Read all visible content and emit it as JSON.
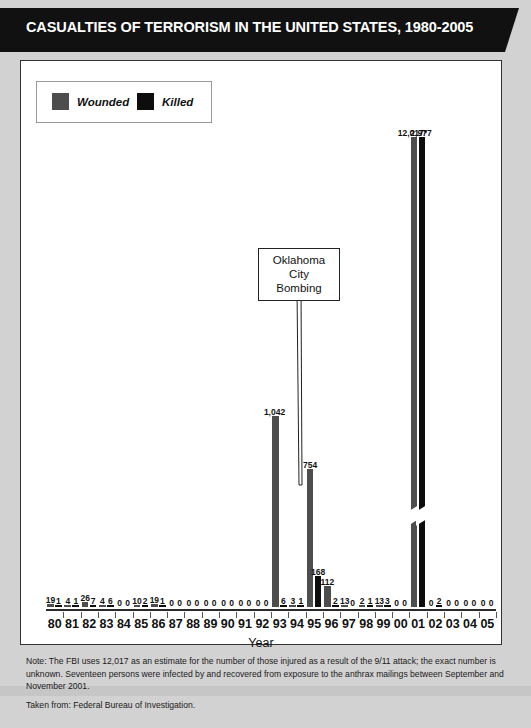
{
  "banner": {
    "title": "CASUALTIES OF TERRORISM IN THE UNITED STATES, 1980-2005"
  },
  "legend": {
    "wounded_label": "Wounded",
    "killed_label": "Killed",
    "wounded_color": "#4d4d4d",
    "killed_color": "#0d0d0d"
  },
  "annotation": {
    "line1": "Oklahoma",
    "line2": "City",
    "line3": "Bombing",
    "points_to_year": "95"
  },
  "footnote": {
    "note": "Note: The FBI uses 12,017 as an estimate for the number of those injured as a result of the 9/11 attack; the exact number is unknown. Seventeen persons were infected by and recovered from exposure to the anthrax mailings between September and November 2001.",
    "source": "Taken from: Federal Bureau of Investigation."
  },
  "chart_data": {
    "type": "bar",
    "title": "CASUALTIES OF TERRORISM IN THE UNITED STATES, 1980-2005",
    "xlabel": "Year",
    "ylabel": "",
    "grid": false,
    "legend_position": "top-left",
    "axis_break": {
      "series": "Wounded",
      "category": "01",
      "note": "bar is truncated with a break mark"
    },
    "categories": [
      "80",
      "81",
      "82",
      "83",
      "84",
      "85",
      "86",
      "87",
      "88",
      "89",
      "90",
      "91",
      "92",
      "93",
      "94",
      "95",
      "96",
      "97",
      "98",
      "99",
      "00",
      "01",
      "02",
      "03",
      "04",
      "05"
    ],
    "series": [
      {
        "name": "Wounded",
        "color": "#4d4d4d",
        "values": [
          19,
          4,
          26,
          4,
          0,
          10,
          19,
          0,
          0,
          0,
          0,
          0,
          0,
          1042,
          3,
          754,
          112,
          13,
          2,
          13,
          0,
          12017,
          0,
          0,
          0,
          0
        ],
        "labels": [
          "19",
          "4",
          "26",
          "4",
          "0",
          "10",
          "19",
          "0",
          "0",
          "0",
          "0",
          "0",
          "0",
          "1,042",
          "3",
          "754",
          "112",
          "13",
          "2",
          "13",
          "0",
          "12,017*",
          "0",
          "0",
          "0",
          "0"
        ]
      },
      {
        "name": "Killed",
        "color": "#0d0d0d",
        "values": [
          1,
          1,
          7,
          6,
          0,
          2,
          1,
          0,
          0,
          0,
          0,
          0,
          0,
          6,
          1,
          168,
          2,
          0,
          1,
          3,
          0,
          2977,
          2,
          0,
          0,
          0
        ],
        "labels": [
          "1",
          "1",
          "7",
          "6",
          "0",
          "2",
          "1",
          "0",
          "0",
          "0",
          "0",
          "0",
          "0",
          "6",
          "1",
          "168",
          "2",
          "0",
          "1",
          "3",
          "0",
          "2,977",
          "2",
          "0",
          "0",
          "0"
        ]
      }
    ],
    "ylim": [
      0,
      3200
    ]
  }
}
